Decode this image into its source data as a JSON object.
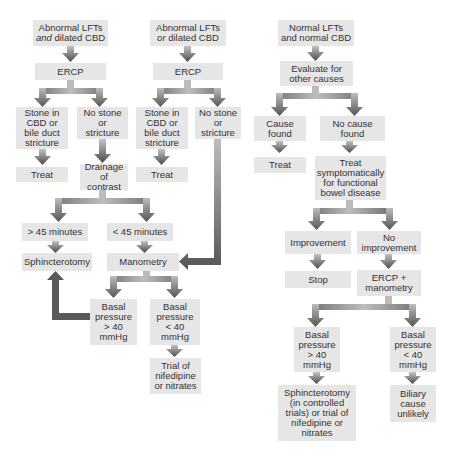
{
  "colors": {
    "box_fill": "#e6e6e6",
    "text": "#333333",
    "arrow_dark": "#555555",
    "arrow_light": "#bbbbbb",
    "background": "#ffffff"
  },
  "nodes": {
    "a_start": {
      "text": "Abnormal LFTs\nand dilated CBD",
      "emphasis": "and"
    },
    "a_ercp": {
      "text": "ERCP"
    },
    "a_stone": {
      "text": "Stone in\nCBD or\nbile duct\nstricture"
    },
    "a_nostone": {
      "text": "No stone\nor\nstricture"
    },
    "a_treat": {
      "text": "Treat"
    },
    "a_drainage": {
      "text": "Drainage\nof contrast"
    },
    "a_gt45": {
      "text": "> 45 minutes"
    },
    "a_lt45": {
      "text": "< 45 minutes"
    },
    "a_sphinc": {
      "text": "Sphincterotomy"
    },
    "manometry": {
      "text": "Manometry"
    },
    "m_high": {
      "text": "Basal\npressure\n> 40\nmmHg"
    },
    "m_low": {
      "text": "Basal\npressure\n< 40\nmmHg"
    },
    "m_trial": {
      "text": "Trial of\nnifedipine\nor nitrates"
    },
    "b_start": {
      "text": "Abnormal LFTs\nor dilated CBD",
      "emphasis": "or"
    },
    "b_ercp": {
      "text": "ERCP"
    },
    "b_stone": {
      "text": "Stone in\nCBD or\nbile duct\nstricture"
    },
    "b_nostone": {
      "text": "No stone\nor\nstricture"
    },
    "b_treat": {
      "text": "Treat"
    },
    "c_start": {
      "text": "Normal LFTs\nand normal CBD"
    },
    "c_evaluate": {
      "text": "Evaluate for\nother causes"
    },
    "c_cause": {
      "text": "Cause\nfound"
    },
    "c_nocause": {
      "text": "No cause\nfound"
    },
    "c_treat": {
      "text": "Treat"
    },
    "c_symptom": {
      "text": "Treat\nsymptomatically\nfor functional\nbowel disease"
    },
    "c_improve": {
      "text": "Improvement"
    },
    "c_noimprove": {
      "text": "No\nimprovement"
    },
    "c_stop": {
      "text": "Stop"
    },
    "c_ercpmano": {
      "text": "ERCP +\nmanometry"
    },
    "c_high": {
      "text": "Basal\npressure\n> 40\nmmHg"
    },
    "c_low": {
      "text": "Basal\npressure\n< 40\nmmHg"
    },
    "c_sphinc": {
      "text": "Sphincterotomy\n(in controlled\ntrials) or trial of\nnifedipine or\nnitrates"
    },
    "c_biliary": {
      "text": "Biliary\ncause\nunlikely"
    }
  },
  "edges": [
    [
      "a_start",
      "a_ercp"
    ],
    [
      "a_ercp",
      "a_stone"
    ],
    [
      "a_ercp",
      "a_nostone"
    ],
    [
      "a_stone",
      "a_treat"
    ],
    [
      "a_nostone",
      "a_drainage"
    ],
    [
      "a_drainage",
      "a_gt45"
    ],
    [
      "a_drainage",
      "a_lt45"
    ],
    [
      "a_gt45",
      "a_sphinc"
    ],
    [
      "a_lt45",
      "manometry"
    ],
    [
      "manometry",
      "m_high"
    ],
    [
      "manometry",
      "m_low"
    ],
    [
      "m_high",
      "a_sphinc"
    ],
    [
      "m_low",
      "m_trial"
    ],
    [
      "b_start",
      "b_ercp"
    ],
    [
      "b_ercp",
      "b_stone"
    ],
    [
      "b_ercp",
      "b_nostone"
    ],
    [
      "b_stone",
      "b_treat"
    ],
    [
      "b_nostone",
      "manometry"
    ],
    [
      "c_start",
      "c_evaluate"
    ],
    [
      "c_evaluate",
      "c_cause"
    ],
    [
      "c_evaluate",
      "c_nocause"
    ],
    [
      "c_cause",
      "c_treat"
    ],
    [
      "c_nocause",
      "c_symptom"
    ],
    [
      "c_symptom",
      "c_improve"
    ],
    [
      "c_symptom",
      "c_noimprove"
    ],
    [
      "c_improve",
      "c_stop"
    ],
    [
      "c_noimprove",
      "c_ercpmano"
    ],
    [
      "c_ercpmano",
      "c_high"
    ],
    [
      "c_ercpmano",
      "c_low"
    ],
    [
      "c_high",
      "c_sphinc"
    ],
    [
      "c_low",
      "c_biliary"
    ]
  ]
}
